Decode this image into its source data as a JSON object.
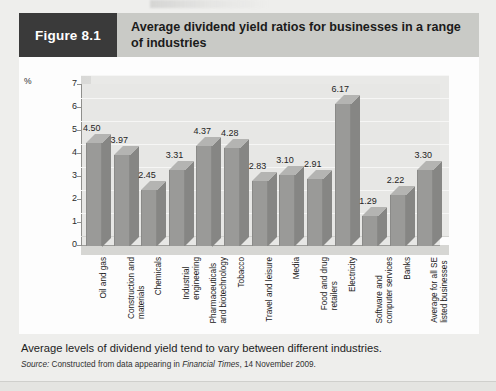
{
  "figure": {
    "tag": "Figure 8.1",
    "title": "Average dividend yield ratios for businesses in a range of industries",
    "caption": "Average levels of dividend yield tend to vary between different industries.",
    "source_prefix": "Source:",
    "source_text_1": "Constructed from data appearing in",
    "source_publication": "Financial Times",
    "source_text_2": ", 14 November 2009."
  },
  "colors": {
    "tag_background": "#3a3a3a",
    "title_background": "#c9cac6",
    "card_background": "#fdfdfd",
    "plot_background": "#e7e7e5",
    "bar_front": "#9a9a98",
    "bar_side": "#868684",
    "bar_top": "#b4b4b2",
    "page_background": "#eeeeec"
  },
  "chart_data": {
    "type": "bar",
    "title": "Average dividend yield ratios for businesses in a range of industries",
    "xlabel": "",
    "ylabel": "%",
    "ylim": [
      0,
      7
    ],
    "yticks": [
      0,
      1,
      2,
      3,
      4,
      5,
      6,
      7
    ],
    "grid": true,
    "legend": "none",
    "categories": [
      "Oil and gas",
      "Construction and materials",
      "Chemicals",
      "Industrial engineering",
      "Pharmaceuticals and biotechnology",
      "Tobacco",
      "Travel and leisure",
      "Media",
      "Food and drug retailers",
      "Electricity",
      "Software and computer services",
      "Banks",
      "Average for all SE listed businesses"
    ],
    "category_lines": [
      [
        "Oil and gas"
      ],
      [
        "Construction and",
        "materials"
      ],
      [
        "Chemicals"
      ],
      [
        "Industrial",
        "engineering"
      ],
      [
        "Pharmaceuticals",
        "and biotechnology"
      ],
      [
        "Tobacco"
      ],
      [
        "Travel and leisure"
      ],
      [
        "Media"
      ],
      [
        "Food and drug",
        "retailers"
      ],
      [
        "Electricity"
      ],
      [
        "Software and",
        "computer services"
      ],
      [
        "Banks"
      ],
      [
        "Average for all SE",
        "listed businesses"
      ]
    ],
    "values": [
      4.5,
      3.97,
      2.45,
      3.31,
      4.37,
      4.28,
      2.83,
      3.1,
      2.91,
      6.17,
      1.29,
      2.22,
      3.3
    ],
    "value_labels": [
      "4.50",
      "3.97",
      "2.45",
      "3.31",
      "4.37",
      "4.28",
      "2.83",
      "3.10",
      "2.91",
      "6.17",
      "1.29",
      "2.22",
      "3.30"
    ]
  }
}
